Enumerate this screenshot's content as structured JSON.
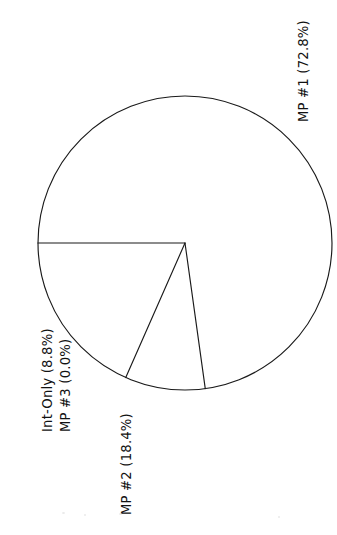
{
  "chart_data": {
    "type": "pie",
    "title": "",
    "subtitle": "",
    "xlabel": "",
    "ylabel": "",
    "legend_position": "none",
    "grid": false,
    "orientation": "rotated-90-ccw",
    "labels": [
      "MP #1",
      "MP #2",
      "Int-Only",
      "MP #3"
    ],
    "values": [
      72.8,
      18.4,
      8.8,
      0.0
    ],
    "units": "%",
    "slice_label_format": "{label} ({value}%)",
    "slices": [
      {
        "label": "MP #1",
        "value": 72.8,
        "display": "MP #1 (72.8%)",
        "start_angle_deg": 180.0,
        "end_angle_deg": 442.1
      },
      {
        "label": "Int-Only",
        "value": 8.8,
        "display": "Int-Only (8.8%)",
        "start_angle_deg": 148.3,
        "end_angle_deg": 180.0
      },
      {
        "label": "MP #3",
        "value": 0.0,
        "display": "MP #3 (0.0%)",
        "start_angle_deg": 148.3,
        "end_angle_deg": 148.3
      },
      {
        "label": "MP #2",
        "value": 18.4,
        "display": "MP #2 (18.4%)",
        "start_angle_deg": 82.1,
        "end_angle_deg": 148.3
      }
    ],
    "geometry": {
      "center_x": 185,
      "center_y": 243,
      "radius": 147,
      "stroke_color": "#1a1a1a",
      "fill_color": "#ffffff"
    }
  },
  "labels": {
    "mp1": "MP #1 (72.8%)",
    "mp2": "MP #2 (18.4%)",
    "mp3": "MP #3 (0.0%)",
    "int_only": "Int-Only (8.8%)"
  },
  "colors": {
    "background": "#ffffff",
    "stroke": "#1a1a1a",
    "text": "#121212"
  }
}
